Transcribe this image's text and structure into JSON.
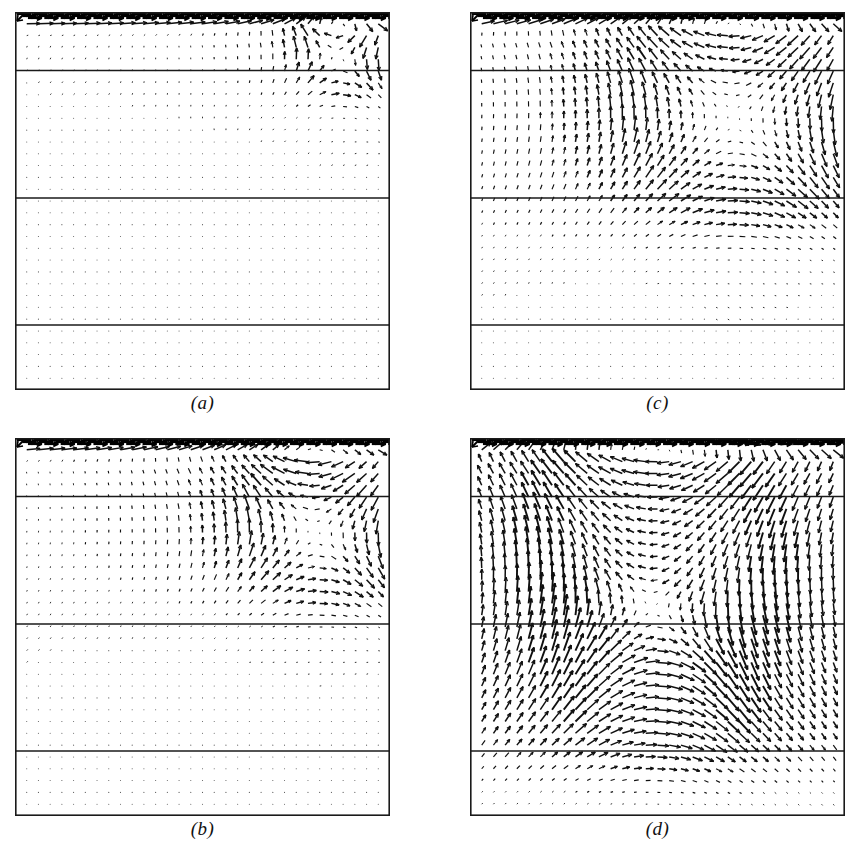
{
  "figure": {
    "kind": "vector-field-quiver-panels",
    "background": "#ffffff",
    "ink": "#101010",
    "width": 865,
    "height": 856,
    "panel_count": 4
  },
  "panels": [
    {
      "id": "a",
      "caption": "(a)",
      "x": 15,
      "y": 12,
      "w": 375,
      "h": 378,
      "caption_y": 392,
      "regime": "weak-flow-confined-to-top-layer",
      "vortex_centers": [
        {
          "cx": 0.86,
          "cy": 0.12,
          "r": 0.1,
          "strength": 1.0
        }
      ],
      "penetration_depth": 0.22,
      "lid_speed": 1.0
    },
    {
      "id": "b",
      "caption": "(b)",
      "x": 15,
      "y": 438,
      "w": 375,
      "h": 378,
      "caption_y": 818,
      "regime": "vortex-entering-second-layer",
      "vortex_centers": [
        {
          "cx": 0.8,
          "cy": 0.25,
          "r": 0.19,
          "strength": 1.0
        }
      ],
      "penetration_depth": 0.44,
      "lid_speed": 1.0
    },
    {
      "id": "c",
      "caption": "(c)",
      "x": 470,
      "y": 12,
      "w": 375,
      "h": 378,
      "caption_y": 392,
      "regime": "large-primary-vortex-in-upper-half",
      "vortex_centers": [
        {
          "cx": 0.7,
          "cy": 0.28,
          "r": 0.28,
          "strength": 1.0
        }
      ],
      "penetration_depth": 0.58,
      "lid_speed": 1.0
    },
    {
      "id": "d",
      "caption": "(d)",
      "x": 470,
      "y": 438,
      "w": 375,
      "h": 378,
      "caption_y": 818,
      "regime": "two-stacked-vortices-filling-cavity",
      "vortex_centers": [
        {
          "cx": 0.5,
          "cy": 0.27,
          "r": 0.33,
          "strength": 1.0
        },
        {
          "cx": 0.48,
          "cy": 0.62,
          "r": 0.26,
          "strength": 0.78
        }
      ],
      "penetration_depth": 0.86,
      "lid_speed": 1.0
    }
  ],
  "layer_interfaces": {
    "label": "horizontal fluid-layer interfaces (fraction of cavity height from top)",
    "fractions": [
      0.155,
      0.492,
      0.828
    ]
  },
  "grid": {
    "label": "velocity sample grid",
    "nx": 33,
    "ny": 33
  },
  "chart_data": {
    "type": "scatter",
    "title": "",
    "xlabel": "",
    "ylabel": "",
    "xlim": [
      0,
      1
    ],
    "ylim": [
      0,
      1
    ],
    "grid": false,
    "legend": "none",
    "series": [
      {
        "name": "(a)",
        "penetration_depth": 0.22,
        "n_vortices": 1,
        "max_speed": 1.0
      },
      {
        "name": "(b)",
        "penetration_depth": 0.44,
        "n_vortices": 1,
        "max_speed": 1.0
      },
      {
        "name": "(c)",
        "penetration_depth": 0.58,
        "n_vortices": 1,
        "max_speed": 1.0
      },
      {
        "name": "(d)",
        "penetration_depth": 0.86,
        "n_vortices": 2,
        "max_speed": 1.0
      }
    ],
    "categories": [
      "(a)",
      "(b)",
      "(c)",
      "(d)"
    ],
    "values": [
      0.22,
      0.44,
      0.58,
      0.86
    ]
  }
}
